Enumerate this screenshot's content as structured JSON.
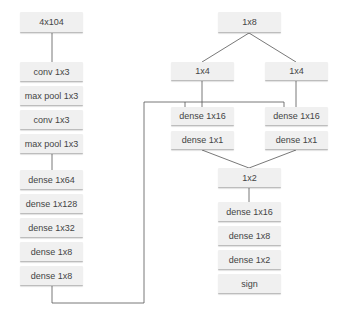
{
  "diagram": {
    "colors": {
      "node_fill": "#f0f0f0",
      "node_text": "#444444",
      "wire": "#555555",
      "background": "#ffffff"
    },
    "nodes": [
      {
        "id": "n0",
        "label": "4x104",
        "x": 20,
        "y": 12,
        "w": 63,
        "h": 21
      },
      {
        "id": "n1",
        "label": "conv 1x3",
        "x": 20,
        "y": 62,
        "w": 63,
        "h": 20
      },
      {
        "id": "n2",
        "label": "max pool 1x3",
        "x": 20,
        "y": 86,
        "w": 63,
        "h": 20
      },
      {
        "id": "n3",
        "label": "conv 1x3",
        "x": 20,
        "y": 110,
        "w": 63,
        "h": 20
      },
      {
        "id": "n4",
        "label": "max pool 1x3",
        "x": 20,
        "y": 134,
        "w": 63,
        "h": 20
      },
      {
        "id": "n5",
        "label": "dense 1x64",
        "x": 20,
        "y": 170,
        "w": 63,
        "h": 20
      },
      {
        "id": "n6",
        "label": "dense 1x128",
        "x": 20,
        "y": 194,
        "w": 63,
        "h": 20
      },
      {
        "id": "n7",
        "label": "dense 1x32",
        "x": 20,
        "y": 218,
        "w": 63,
        "h": 20
      },
      {
        "id": "n8",
        "label": "dense 1x8",
        "x": 20,
        "y": 242,
        "w": 63,
        "h": 20
      },
      {
        "id": "n9",
        "label": "dense 1x8",
        "x": 20,
        "y": 266,
        "w": 63,
        "h": 20
      },
      {
        "id": "n10",
        "label": "1x8",
        "x": 218,
        "y": 12,
        "w": 63,
        "h": 21
      },
      {
        "id": "n11",
        "label": "1x4",
        "x": 171,
        "y": 62,
        "w": 63,
        "h": 19
      },
      {
        "id": "n12",
        "label": "1x4",
        "x": 265,
        "y": 62,
        "w": 63,
        "h": 19
      },
      {
        "id": "n13",
        "label": "dense 1x16",
        "x": 171,
        "y": 107,
        "w": 63,
        "h": 19
      },
      {
        "id": "n14",
        "label": "dense 1x16",
        "x": 265,
        "y": 107,
        "w": 63,
        "h": 19
      },
      {
        "id": "n15",
        "label": "dense 1x1",
        "x": 171,
        "y": 131,
        "w": 63,
        "h": 19
      },
      {
        "id": "n16",
        "label": "dense 1x1",
        "x": 265,
        "y": 131,
        "w": 63,
        "h": 19
      },
      {
        "id": "n17",
        "label": "1x2",
        "x": 218,
        "y": 168,
        "w": 63,
        "h": 20
      },
      {
        "id": "n18",
        "label": "dense 1x16",
        "x": 218,
        "y": 202,
        "w": 63,
        "h": 20
      },
      {
        "id": "n19",
        "label": "dense 1x8",
        "x": 218,
        "y": 226,
        "w": 63,
        "h": 20
      },
      {
        "id": "n20",
        "label": "dense 1x2",
        "x": 218,
        "y": 250,
        "w": 63,
        "h": 20
      },
      {
        "id": "n21",
        "label": "sign",
        "x": 218,
        "y": 274,
        "w": 63,
        "h": 20
      }
    ]
  }
}
